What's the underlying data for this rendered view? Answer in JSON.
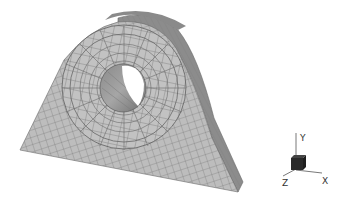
{
  "scene": {
    "description": "Finite element quad mesh of a pillow block bracket with a raised boss and through hole",
    "colors": {
      "background": "#ffffff",
      "face_light": "#c4c4c4",
      "face_mid": "#b4b4b4",
      "side_dark": "#8a8a8a",
      "mesh_line": "#6a6a6a",
      "hole_inner_dark": "#7e7e7e",
      "hole_inner_light": "#a2a2a2"
    }
  },
  "triad": {
    "labels": {
      "x": "X",
      "y": "Y",
      "z": "Z"
    },
    "cube_color": "#2a2a2a",
    "line_color": "#555555"
  }
}
